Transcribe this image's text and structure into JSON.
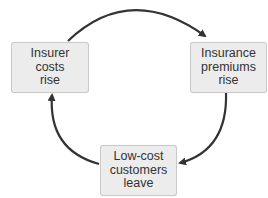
{
  "diagram": {
    "type": "cycle",
    "nodes": [
      {
        "id": "insurer-costs",
        "lines": [
          "Insurer",
          "costs",
          "rise"
        ]
      },
      {
        "id": "premiums",
        "lines": [
          "Insurance",
          "premiums",
          "rise"
        ]
      },
      {
        "id": "customers-leave",
        "lines": [
          "Low-cost",
          "customers",
          "leave"
        ]
      }
    ],
    "edges": [
      {
        "from": "insurer-costs",
        "to": "premiums"
      },
      {
        "from": "premiums",
        "to": "customers-leave"
      },
      {
        "from": "customers-leave",
        "to": "insurer-costs"
      }
    ],
    "colors": {
      "box_fill": "#ececec",
      "box_border": "#c9c9c9",
      "arrow": "#333333",
      "text": "#333333"
    }
  }
}
